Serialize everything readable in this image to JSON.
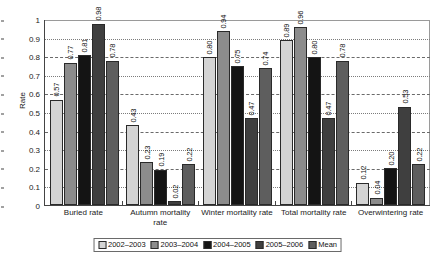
{
  "chart_data": {
    "type": "bar",
    "title": "",
    "xlabel": "",
    "ylabel": "Rate",
    "ylim": [
      0,
      1
    ],
    "ytick_step": 0.1,
    "grid": true,
    "legend_position": "bottom",
    "categories": [
      "Buried rate",
      "Autumn mortality rate",
      "Winter mortality rate",
      "Total mortality rate",
      "Overwintering rate"
    ],
    "ytick_labels": [
      "1",
      "0.9",
      "0.8",
      "0.7",
      "0.6",
      "0.5",
      "0.4",
      "0.3",
      "0.2",
      "0.1",
      "0"
    ],
    "ytick_values": [
      1,
      0.9,
      0.8,
      0.7,
      0.6,
      0.5,
      0.4,
      0.3,
      0.2,
      0.1,
      0
    ],
    "series": [
      {
        "name": "2002–2003",
        "color": "#d4d4d4",
        "values": [
          0.57,
          0.43,
          0.8,
          0.89,
          0.12
        ],
        "labels": [
          "0.57",
          "0.43",
          "0.80",
          "0.89",
          "0.12"
        ]
      },
      {
        "name": "2003–2004",
        "color": "#8c8c8c",
        "values": [
          0.77,
          0.23,
          0.94,
          0.96,
          0.04
        ],
        "labels": [
          "0.77",
          "0.23",
          "0.94",
          "0.96",
          "0.04"
        ]
      },
      {
        "name": "2004–2005",
        "color": "#141414",
        "values": [
          0.81,
          0.19,
          0.75,
          0.8,
          0.2
        ],
        "labels": [
          "0.81",
          "0.19",
          "0.75",
          "0.80",
          "0.20"
        ]
      },
      {
        "name": "2005–2006",
        "color": "#3f3f3f",
        "values": [
          0.98,
          0.02,
          0.47,
          0.47,
          0.53
        ],
        "labels": [
          "0.98",
          "0.02",
          "0.47",
          "0.47",
          "0.53"
        ]
      },
      {
        "name": "Mean",
        "color": "#5e5e5e",
        "values": [
          0.78,
          0.22,
          0.74,
          0.78,
          0.22
        ],
        "labels": [
          "0.78",
          "0.22",
          "0.74",
          "0.78",
          "0.22"
        ]
      }
    ]
  },
  "axis": {
    "y_title": "Rate"
  }
}
